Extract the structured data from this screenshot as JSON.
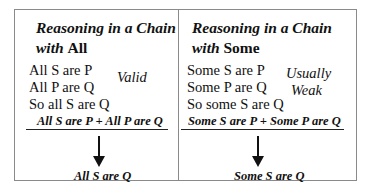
{
  "left_panel": {
    "title_line1": "Reasoning in a Chain",
    "title_line2_italic": "with",
    "title_line2_plain": "All",
    "premises": [
      "All S are P",
      "All P are Q",
      "So all S are Q"
    ],
    "verdict": [
      "Valid"
    ],
    "formula": "All S are P  + All P are Q",
    "arrow": "down-arrow",
    "conclusion": "All S are Q"
  },
  "right_panel": {
    "title_line1": "Reasoning in a Chain",
    "title_line2_italic": "with",
    "title_line2_plain": "Some",
    "premises": [
      "Some S are P",
      "Some P are Q",
      "So some S are Q"
    ],
    "verdict": [
      "Usually",
      "Weak"
    ],
    "formula": "Some S are P  + Some P are Q",
    "arrow": "down-arrow",
    "conclusion": "Some S are Q"
  }
}
